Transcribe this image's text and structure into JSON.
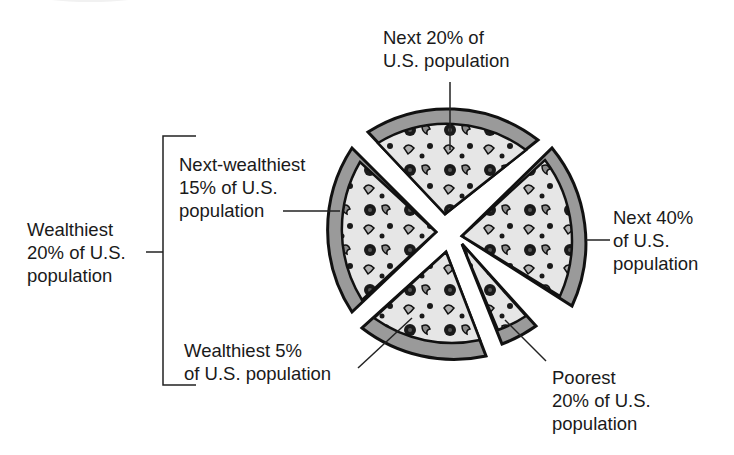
{
  "diagram": {
    "type": "pizza-slice distribution",
    "slices": [
      {
        "id": "next-20",
        "label": "Next 20% of\nU.S. population",
        "group": "Next 20%"
      },
      {
        "id": "next-40",
        "label": "Next 40%\nof U.S.\npopulation",
        "group": "Next 40%"
      },
      {
        "id": "poorest-20",
        "label": "Poorest\n20% of U.S.\npopulation",
        "group": "Poorest 20%"
      },
      {
        "id": "wealthiest-5",
        "label": "Wealthiest 5%\nof U.S. population",
        "group": "Wealthiest 5%"
      },
      {
        "id": "next-wealthiest-15",
        "label": "Next-wealthiest\n15% of U.S.\npopulation",
        "group": "Next-wealthiest 15%"
      }
    ],
    "bracket_label": "Wealthiest\n20% of U.S.\npopulation"
  },
  "colors": {
    "crust": "#9a9a9a",
    "cheese": "#e6e6e6",
    "outline": "#111111",
    "text": "#1a1a1a",
    "background": "#ffffff"
  }
}
